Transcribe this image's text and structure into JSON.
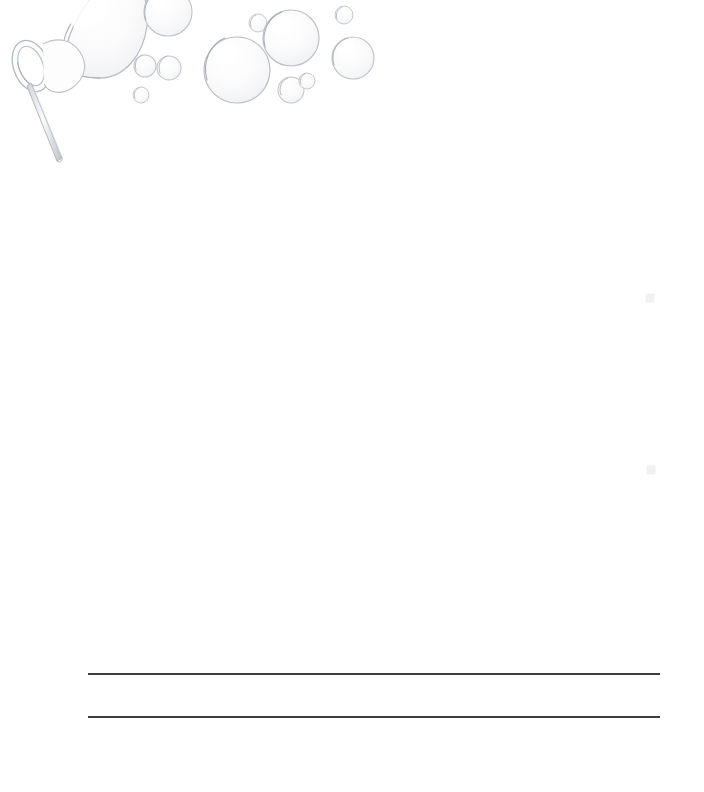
{
  "page": {
    "title": "Bubble Wand Stationery",
    "kind": "scanned-blank-worksheet",
    "width_px": 704,
    "height_px": 792,
    "background_color": "#ffffff",
    "paper_tint": "#fefefe"
  },
  "artwork": {
    "name": "bubble-wand-illustration",
    "description": "Line drawing of a bubble wand with a large bubble forming at the loop and small bubbles drifting to the right",
    "line_color": "#b9bcc2",
    "line_color_dark": "#9aa0a8",
    "bubble_fill": "#f7f7f8",
    "bubble_stroke": "#c2c6cc",
    "wand": {
      "name": "bubble-wand",
      "ring_center_x": 30,
      "ring_center_y": 66,
      "ring_rx": 17,
      "ring_ry": 26,
      "ring_rotation_deg": -22,
      "handle_start_x": 33,
      "handle_start_y": 84,
      "handle_end_x": 63,
      "handle_end_y": 161,
      "handle_width": 5
    },
    "forming_bubble": {
      "name": "forming-bubble",
      "cx": 101,
      "cy": 28,
      "r": 46
    },
    "bubbles": [
      {
        "name": "bubble-1",
        "cx": 168,
        "cy": 12,
        "r": 24
      },
      {
        "name": "bubble-2",
        "cx": 145,
        "cy": 66,
        "r": 11
      },
      {
        "name": "bubble-3",
        "cx": 169,
        "cy": 68,
        "r": 12
      },
      {
        "name": "bubble-4",
        "cx": 141,
        "cy": 95,
        "r": 8
      },
      {
        "name": "bubble-5",
        "cx": 237,
        "cy": 70,
        "r": 33
      },
      {
        "name": "bubble-6",
        "cx": 258,
        "cy": 23,
        "r": 9
      },
      {
        "name": "bubble-7",
        "cx": 291,
        "cy": 38,
        "r": 28
      },
      {
        "name": "bubble-8",
        "cx": 291,
        "cy": 90,
        "r": 13
      },
      {
        "name": "bubble-9",
        "cx": 307,
        "cy": 81,
        "r": 8
      },
      {
        "name": "bubble-10",
        "cx": 344,
        "cy": 15,
        "r": 9
      },
      {
        "name": "bubble-11",
        "cx": 353,
        "cy": 58,
        "r": 21
      }
    ]
  },
  "writing_area": {
    "name": "writing-lines",
    "line_color": "#3b3d40",
    "line_thickness_px": 2,
    "left_px": 88,
    "right_px": 660,
    "length_px": 572,
    "lines": [
      {
        "name": "writing-line-1",
        "index": 1,
        "y_px": 673
      },
      {
        "name": "writing-line-2",
        "index": 2,
        "y_px": 716
      }
    ]
  },
  "scan_artifacts": {
    "name": "scan-smudges",
    "color": "#ededef",
    "marks": [
      {
        "name": "smudge-1",
        "x": 650,
        "y": 298,
        "w": 9,
        "h": 9
      },
      {
        "name": "smudge-2",
        "x": 651,
        "y": 470,
        "w": 9,
        "h": 9
      }
    ]
  }
}
